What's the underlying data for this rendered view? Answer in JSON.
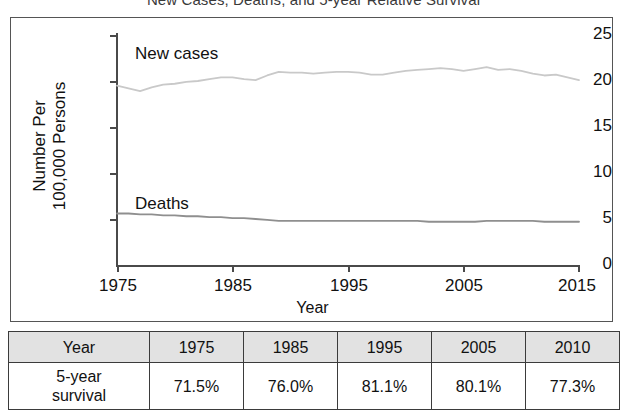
{
  "title": "New Cases, Deaths, and 5-year Relative Survival",
  "chart_data": {
    "type": "line",
    "title": "New Cases, Deaths, and 5-year Relative Survival",
    "xlabel": "Year",
    "ylabel": "Number Per 100,000 Persons",
    "ylabel_lines": [
      "Number Per",
      "100,000 Persons"
    ],
    "xlim": [
      1975,
      2015
    ],
    "ylim": [
      0,
      25
    ],
    "yticks": [
      0,
      5,
      10,
      15,
      20,
      25
    ],
    "xticks": [
      1975,
      1985,
      1995,
      2005,
      2015
    ],
    "grid": false,
    "legend": "inline-labels",
    "colors": {
      "new_cases": "#c9c9c9",
      "deaths": "#8f8f8f",
      "axis": "#4a4a4a",
      "table_header_bg": "#e2e2e2",
      "table_border": "#3b3b3b"
    },
    "x": [
      1975,
      1976,
      1977,
      1978,
      1979,
      1980,
      1981,
      1982,
      1983,
      1984,
      1985,
      1986,
      1987,
      1988,
      1989,
      1990,
      1991,
      1992,
      1993,
      1994,
      1995,
      1996,
      1997,
      1998,
      1999,
      2000,
      2001,
      2002,
      2003,
      2004,
      2005,
      2006,
      2007,
      2008,
      2009,
      2010,
      2011,
      2012,
      2013,
      2014,
      2015
    ],
    "series": [
      {
        "name": "New cases",
        "label": "New cases",
        "color": "#c9c9c9",
        "values": [
          19.5,
          19.2,
          18.9,
          19.3,
          19.6,
          19.7,
          19.9,
          20.0,
          20.2,
          20.4,
          20.4,
          20.2,
          20.1,
          20.6,
          21.0,
          20.9,
          20.9,
          20.8,
          20.9,
          21.0,
          21.0,
          20.9,
          20.7,
          20.7,
          20.9,
          21.1,
          21.2,
          21.3,
          21.4,
          21.3,
          21.1,
          21.3,
          21.5,
          21.2,
          21.3,
          21.1,
          20.8,
          20.6,
          20.7,
          20.4,
          20.1
        ]
      },
      {
        "name": "Deaths",
        "label": "Deaths",
        "color": "#8f8f8f",
        "values": [
          5.6,
          5.6,
          5.5,
          5.5,
          5.4,
          5.4,
          5.3,
          5.3,
          5.2,
          5.2,
          5.1,
          5.1,
          5.0,
          4.9,
          4.8,
          4.8,
          4.8,
          4.8,
          4.8,
          4.8,
          4.8,
          4.8,
          4.8,
          4.8,
          4.8,
          4.8,
          4.8,
          4.7,
          4.7,
          4.7,
          4.7,
          4.7,
          4.8,
          4.8,
          4.8,
          4.8,
          4.8,
          4.7,
          4.7,
          4.7,
          4.7
        ]
      }
    ]
  },
  "table": {
    "header": [
      "Year",
      "1975",
      "1985",
      "1995",
      "2005",
      "2010"
    ],
    "rows": [
      {
        "label_line1": "5-year",
        "label_line2": "survival",
        "values": [
          "71.5%",
          "76.0%",
          "81.1%",
          "80.1%",
          "77.3%"
        ]
      }
    ]
  }
}
